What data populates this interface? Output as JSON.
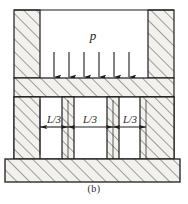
{
  "figure": {
    "caption": "(b)",
    "pressure_label": "p",
    "dimension_labels": [
      "L/3",
      "L/3",
      "L/3"
    ],
    "arrow_count": 6,
    "colors": {
      "line": "#1d1d1d",
      "hatch": "#4a4a4a",
      "fill": "#f2f1ee",
      "background": "#ffffff"
    },
    "parts": {
      "left_column": "left-hatched-column",
      "right_column": "right-hatched-column",
      "top_beam": "upper-hatched-beam",
      "base_slab": "bottom-hatched-base-slab",
      "mid_columns": [
        "mid-column-1",
        "mid-column-2",
        "mid-column-3",
        "mid-column-4"
      ],
      "load": "distributed-pressure-load"
    }
  }
}
